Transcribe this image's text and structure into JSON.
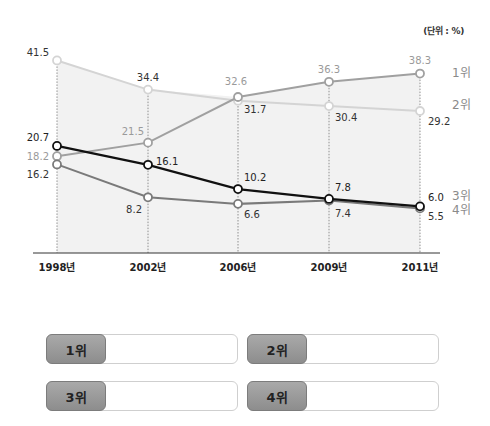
{
  "chart_data": {
    "type": "line",
    "title": "",
    "unit_label": "(단위 : %)",
    "xlabel": "",
    "ylabel": "",
    "categories": [
      "1998년",
      "2002년",
      "2006년",
      "2009년",
      "2011년"
    ],
    "ylim": [
      0,
      45
    ],
    "grid": "vertical dotted lines at each category",
    "legend": "right (series labels at line ends)",
    "series": [
      {
        "name": "line_A",
        "end_label": "1위",
        "color": "#a0a0a0",
        "label_color": "#9a9a9a",
        "values": [
          18.2,
          21.5,
          32.6,
          36.3,
          38.3
        ],
        "data_labels": [
          "18.2",
          "21.5",
          "32.6",
          "36.3",
          "38.3"
        ]
      },
      {
        "name": "line_B",
        "end_label": "2위",
        "color": "#d4d4d4",
        "label_color": "#333333",
        "values": [
          41.5,
          34.4,
          31.7,
          30.4,
          29.2
        ],
        "data_labels": [
          "41.5",
          "34.4",
          "31.7",
          "30.4",
          "29.2"
        ]
      },
      {
        "name": "line_C",
        "end_label": "3위",
        "color": "#111111",
        "label_color": "#222222",
        "values": [
          20.7,
          16.1,
          10.2,
          7.8,
          6.0
        ],
        "data_labels": [
          "20.7",
          "16.1",
          "10.2",
          "7.8",
          "6.0"
        ]
      },
      {
        "name": "line_D",
        "end_label": "4위",
        "color": "#7a7a7a",
        "label_color": "#333333",
        "values": [
          16.2,
          8.2,
          6.6,
          7.4,
          5.5
        ],
        "data_labels": [
          "16.2",
          "8.2",
          "6.6",
          "7.4",
          "5.5"
        ]
      }
    ],
    "end_label_color": "#8a8a8a",
    "area_fill": "#f2f2f2"
  },
  "answer_boxes": [
    {
      "label": "1위",
      "value": ""
    },
    {
      "label": "2위",
      "value": ""
    },
    {
      "label": "3위",
      "value": ""
    },
    {
      "label": "4위",
      "value": ""
    }
  ]
}
